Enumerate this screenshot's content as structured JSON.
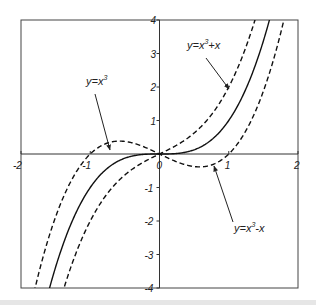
{
  "chart_data": {
    "type": "line",
    "title": "",
    "xlabel": "",
    "ylabel": "",
    "xlim": [
      -2,
      2
    ],
    "ylim": [
      -4,
      4
    ],
    "grid": false,
    "legend": "none (inline arrow annotations)",
    "x_ticks": [
      "-2",
      "-1",
      "0",
      "1",
      "2"
    ],
    "y_ticks": [
      "-4",
      "-3",
      "-2",
      "-1",
      "0",
      "1",
      "2",
      "3",
      "4"
    ],
    "series": [
      {
        "name": "y=x^3",
        "style": "solid",
        "formula": "x^3",
        "x": [
          -1.59,
          -1.5,
          -1,
          -0.5,
          0,
          0.5,
          1,
          1.5,
          1.59
        ],
        "y": [
          -4.0,
          -3.375,
          -1.0,
          -0.125,
          0,
          0.125,
          1.0,
          3.375,
          4.0
        ]
      },
      {
        "name": "y=x^3+x",
        "style": "dashed",
        "formula": "x^3+x",
        "x": [
          -1.38,
          -1,
          -0.5,
          0,
          0.5,
          1,
          1.38
        ],
        "y": [
          -4.0,
          -2.0,
          -0.625,
          0,
          0.625,
          2.0,
          4.0
        ]
      },
      {
        "name": "y=x^3-x",
        "style": "dashed",
        "formula": "x^3-x",
        "x": [
          -1.8,
          -1.5,
          -1,
          -0.577,
          0,
          0.577,
          1,
          1.5,
          1.8
        ],
        "y": [
          -4.0,
          -1.875,
          0,
          0.385,
          0,
          -0.385,
          0,
          1.875,
          4.0
        ]
      }
    ],
    "annotations": [
      {
        "text": "y=x3",
        "label_display": "y=x",
        "superscript": "3",
        "points_to": "solid curve near (-0.75,-0.4)"
      },
      {
        "text": "y=x3+x",
        "label_display": "y=x",
        "superscript": "3",
        "suffix": "+x",
        "points_to": "upper dashed curve near (0.75,2.0)"
      },
      {
        "text": "y=x3-x",
        "label_display": "y=x",
        "superscript": "3",
        "suffix": "-x",
        "points_to": "lower dashed curve near (0.55,-0.35)"
      }
    ]
  }
}
